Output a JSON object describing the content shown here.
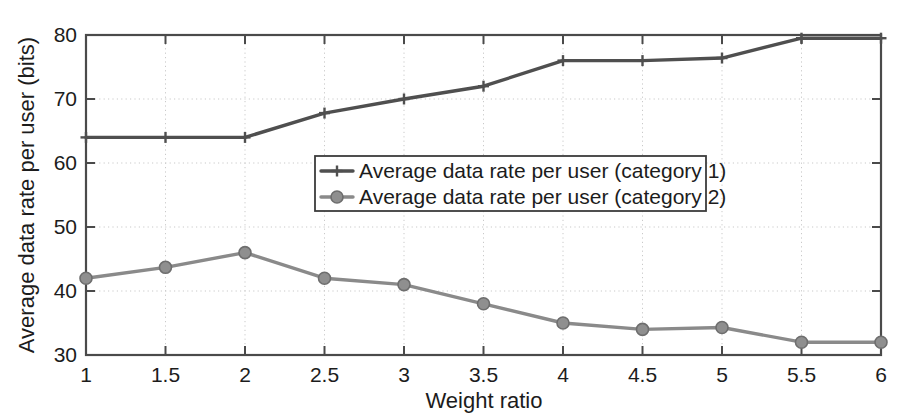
{
  "chart_data": {
    "type": "line",
    "title": "",
    "xlabel": "Weight ratio",
    "ylabel": "Average data rate per user (bits)",
    "xlim": [
      1,
      6
    ],
    "ylim": [
      30,
      80
    ],
    "xticks": [
      "1",
      "1.5",
      "2",
      "2.5",
      "3",
      "3.5",
      "4",
      "4.5",
      "5",
      "5.5",
      "6"
    ],
    "xtick_values": [
      1,
      1.5,
      2,
      2.5,
      3,
      3.5,
      4,
      4.5,
      5,
      5.5,
      6
    ],
    "yticks": [
      "30",
      "40",
      "50",
      "60",
      "70",
      "80"
    ],
    "ytick_values": [
      30,
      40,
      50,
      60,
      70,
      80
    ],
    "grid": true,
    "legend_position": "center",
    "x": [
      1,
      1.5,
      2,
      2.5,
      3,
      3.5,
      4,
      4.5,
      5,
      5.5,
      6
    ],
    "series": [
      {
        "name": "Average data rate per user (category 1)",
        "marker": "plus",
        "color": "#4f4f4f",
        "values": [
          64,
          64,
          64,
          67.8,
          70,
          72,
          76,
          76,
          76.4,
          79.5,
          79.5
        ]
      },
      {
        "name": "Average data rate per user (category 2)",
        "marker": "circle",
        "color": "#8f8f8f",
        "values": [
          42,
          43.7,
          46,
          42,
          41,
          38,
          35,
          34,
          34.3,
          32,
          32
        ]
      }
    ]
  },
  "legend": {
    "items": [
      {
        "label": "Average data rate per user (category 1)"
      },
      {
        "label": "Average data rate per user (category 2)"
      }
    ]
  },
  "colors": {
    "series1": "#4f4f4f",
    "series2": "#8f8f8f",
    "axis": "#4a4a4a",
    "grid": "#c9c9c9",
    "text": "#1c1c1c",
    "background": "#ffffff"
  }
}
